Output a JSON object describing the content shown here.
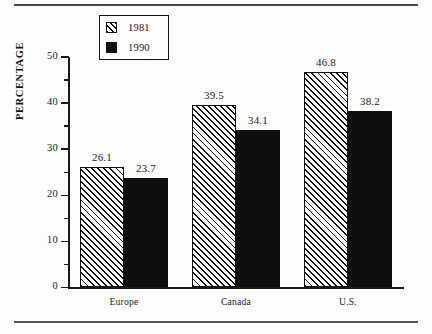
{
  "page": {
    "background_color": "#fdfdfb",
    "ink_color": "#111111",
    "rule_top": "horizontal-rule",
    "rule_bottom": "horizontal-rule"
  },
  "chart_data": {
    "type": "bar",
    "title": "",
    "subtitle": "",
    "xlabel": "",
    "ylabel": "PERCENTAGE",
    "categories": [
      "Europe",
      "Canada",
      "U.S."
    ],
    "series": [
      {
        "name": "1981",
        "values": [
          26.1,
          39.5,
          46.8
        ],
        "value_labels": [
          "26.1",
          "39.5",
          "46.8"
        ],
        "fill": "diagonal-hatch",
        "color": "#111111"
      },
      {
        "name": "1990",
        "values": [
          23.7,
          34.1,
          38.2
        ],
        "value_labels": [
          "23.7",
          "34.1",
          "38.2"
        ],
        "fill": "solid",
        "color": "#100f0f"
      }
    ],
    "ylim": [
      0,
      50
    ],
    "ytick_labels": [
      "0",
      "10",
      "20",
      "30",
      "40",
      "50"
    ],
    "ytick_values": [
      0,
      10,
      20,
      30,
      40,
      50
    ],
    "yminor_tick_values": [
      5,
      15,
      25,
      35,
      45
    ],
    "grid": false,
    "legend_position": "upper-left-inside",
    "data_labels_shown": true,
    "axis_spines": [
      "left",
      "bottom"
    ]
  }
}
